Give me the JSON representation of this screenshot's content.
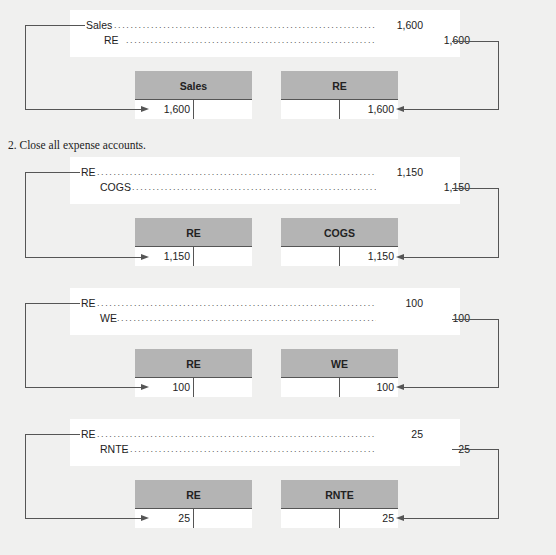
{
  "section_2_label": "2.  Close all expense accounts.",
  "entries": [
    {
      "debit_account": "Sales",
      "credit_account": "RE",
      "debit_amount": "1,600",
      "credit_amount": "1,600",
      "t_left": {
        "title": "Sales",
        "debit_value": "1,600"
      },
      "t_right": {
        "title": "RE",
        "credit_value": "1,600"
      }
    },
    {
      "debit_account": "RE",
      "credit_account": "COGS",
      "debit_amount": "1,150",
      "credit_amount": "1,150",
      "t_left": {
        "title": "RE",
        "debit_value": "1,150"
      },
      "t_right": {
        "title": "COGS",
        "credit_value": "1,150"
      }
    },
    {
      "debit_account": "RE",
      "credit_account": "WE",
      "debit_amount": "100",
      "credit_amount": "100",
      "t_left": {
        "title": "RE",
        "debit_value": "100"
      },
      "t_right": {
        "title": "WE",
        "credit_value": "100"
      }
    },
    {
      "debit_account": "RE",
      "credit_account": "RNTE",
      "debit_amount": "25",
      "credit_amount": "25",
      "t_left": {
        "title": "RE",
        "debit_value": "25"
      },
      "t_right": {
        "title": "RNTE",
        "credit_value": "25"
      }
    }
  ],
  "dots": "........................................................................",
  "colors": {
    "background": "#f0f0ef",
    "panel": "#ffffff",
    "t_header": "#b4b4b4",
    "line": "#555555"
  }
}
